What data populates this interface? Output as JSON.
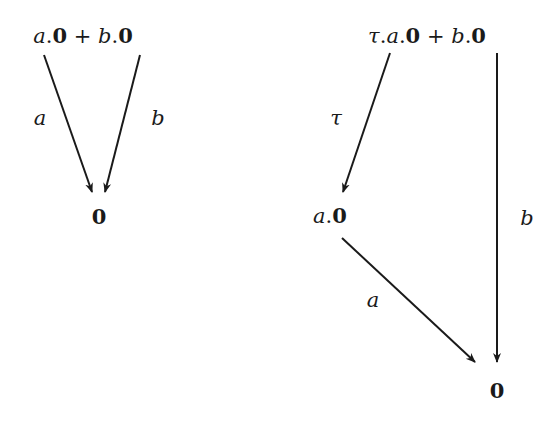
{
  "diagrams": [
    {
      "name": "left",
      "root": {
        "label": "a.0 + b.0",
        "parts": [
          "a",
          ".",
          "0",
          " + ",
          "b",
          ".",
          "0"
        ]
      },
      "nodes": [
        {
          "id": "zero",
          "label": "0"
        }
      ],
      "edges": [
        {
          "from": "root",
          "to": "zero",
          "label": "a"
        },
        {
          "from": "root",
          "to": "zero",
          "label": "b"
        }
      ]
    },
    {
      "name": "right",
      "root": {
        "label": "τ.a.0 + b.0",
        "parts": [
          "τ",
          ".",
          "a",
          ".",
          "0",
          " + ",
          "b",
          ".",
          "0"
        ]
      },
      "nodes": [
        {
          "id": "a0",
          "label": "a.0",
          "parts": [
            "a",
            ".",
            "0"
          ]
        },
        {
          "id": "zero",
          "label": "0"
        }
      ],
      "edges": [
        {
          "from": "root",
          "to": "a0",
          "label": "τ"
        },
        {
          "from": "root",
          "to": "zero",
          "label": "b"
        },
        {
          "from": "a0",
          "to": "zero",
          "label": "a"
        }
      ]
    }
  ],
  "colors": {
    "ink": "#1a1a1a",
    "background": "#ffffff"
  }
}
